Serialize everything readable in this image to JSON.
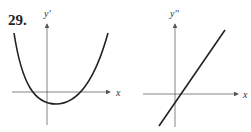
{
  "problem": {
    "number": "29."
  },
  "graphs": [
    {
      "id": "left",
      "y_axis_label": "y'",
      "x_axis_label": "x",
      "curve": "parabola opening upward, vertex slightly right of y-axis below x-axis"
    },
    {
      "id": "right",
      "y_axis_label": "y''",
      "x_axis_label": "x",
      "curve": "straight line with positive slope crossing x-axis slightly right of origin"
    }
  ],
  "colors": {
    "axis": "#555555",
    "curve": "#222222"
  }
}
